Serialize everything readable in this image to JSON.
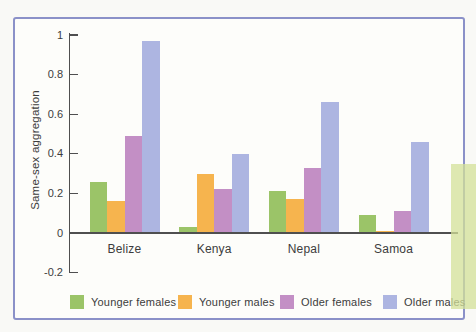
{
  "figure": {
    "ylabel": "Same-sex aggregation"
  },
  "chart_data": {
    "type": "bar",
    "title": "",
    "xlabel": "",
    "ylabel": "Same-sex aggregation",
    "categories": [
      "Belize",
      "Kenya",
      "Nepal",
      "Samoa"
    ],
    "series": [
      {
        "name": "Younger females",
        "color": "#9bc468",
        "values": [
          0.26,
          0.03,
          0.21,
          0.09
        ]
      },
      {
        "name": "Younger males",
        "color": "#f6b44e",
        "values": [
          0.16,
          0.3,
          0.17,
          0.01
        ]
      },
      {
        "name": "Older females",
        "color": "#c38fc5",
        "values": [
          0.49,
          0.22,
          0.33,
          0.11
        ]
      },
      {
        "name": "Older males",
        "color": "#adb5e1",
        "values": [
          0.97,
          0.4,
          0.66,
          0.46
        ]
      }
    ],
    "ylim": [
      -0.2,
      1
    ],
    "yticks": [
      1,
      0.8,
      0.6,
      0.4,
      0.2,
      0,
      -0.2
    ],
    "grid": false,
    "legend_position": "bottom"
  },
  "colors": {
    "frame_border": "#8b91c8",
    "frame_background": "#fdfdfa",
    "axis": "#4f4f4f",
    "text": "#3c3c3c",
    "page_accent_strip": "#d3e098"
  }
}
